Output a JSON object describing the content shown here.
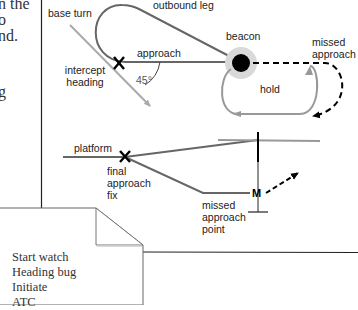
{
  "left_text_fragments": [
    "n the",
    "o",
    "nd.",
    "g"
  ],
  "diagram": {
    "top": {
      "labels": {
        "base_turn": "base turn",
        "outbound_leg": "outbound leg",
        "approach": "approach",
        "intercept_heading_1": "intercept",
        "intercept_heading_2": "heading",
        "angle": "45°",
        "beacon": "beacon",
        "missed_approach_1": "missed",
        "missed_approach_2": "approach",
        "hold": "hold"
      },
      "markers": {
        "fix": "X"
      }
    },
    "bottom": {
      "labels": {
        "platform": "platform",
        "final_approach_fix_1": "final",
        "final_approach_fix_2": "approach",
        "final_approach_fix_3": "fix",
        "missed_approach_point_1": "missed",
        "missed_approach_point_2": "approach",
        "missed_approach_point_3": "point"
      },
      "markers": {
        "fix": "X",
        "map": "M"
      }
    },
    "colors": {
      "line_dark": "#555555",
      "line_light": "#999999",
      "beacon_halo": "#d9d9d9",
      "beacon": "#000000"
    }
  },
  "note": {
    "items": [
      "Start watch",
      "Heading bug",
      "Initiate",
      "ATC"
    ]
  }
}
